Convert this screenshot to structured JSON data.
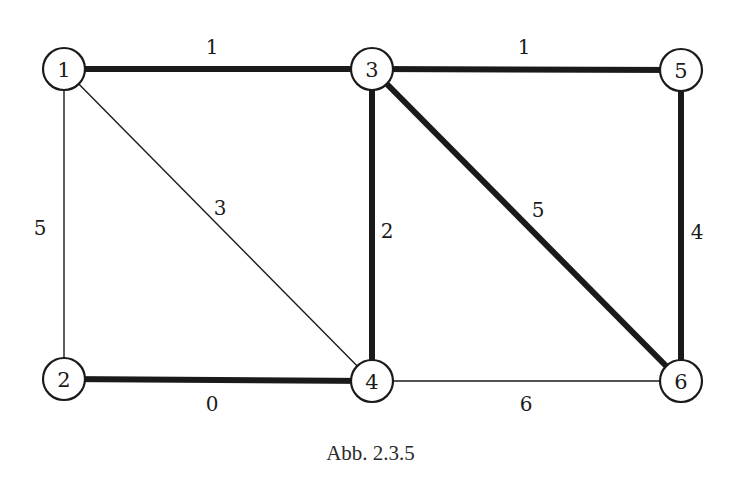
{
  "figure": {
    "caption": "Abb. 2.3.5",
    "colors": {
      "stroke": "#1a1a1a",
      "background": "#ffffff"
    }
  },
  "graph": {
    "nodes": [
      {
        "id": "1",
        "label": "1",
        "x": 64,
        "y": 69
      },
      {
        "id": "2",
        "label": "2",
        "x": 64,
        "y": 379
      },
      {
        "id": "3",
        "label": "3",
        "x": 372,
        "y": 69
      },
      {
        "id": "4",
        "label": "4",
        "x": 372,
        "y": 381
      },
      {
        "id": "5",
        "label": "5",
        "x": 681,
        "y": 70
      },
      {
        "id": "6",
        "label": "6",
        "x": 681,
        "y": 381
      }
    ],
    "edges": [
      {
        "from": "1",
        "to": "3",
        "weight": "1",
        "bold": true,
        "label_x": 212,
        "label_y": 47
      },
      {
        "from": "3",
        "to": "5",
        "weight": "1",
        "bold": true,
        "label_x": 524,
        "label_y": 47
      },
      {
        "from": "1",
        "to": "2",
        "weight": "5",
        "bold": false,
        "label_x": 40,
        "label_y": 228
      },
      {
        "from": "1",
        "to": "4",
        "weight": "3",
        "bold": false,
        "label_x": 220,
        "label_y": 208
      },
      {
        "from": "3",
        "to": "4",
        "weight": "2",
        "bold": true,
        "label_x": 387,
        "label_y": 231
      },
      {
        "from": "3",
        "to": "6",
        "weight": "5",
        "bold": true,
        "label_x": 538,
        "label_y": 210
      },
      {
        "from": "5",
        "to": "6",
        "weight": "4",
        "bold": true,
        "label_x": 697,
        "label_y": 232
      },
      {
        "from": "2",
        "to": "4",
        "weight": "0",
        "bold": true,
        "label_x": 212,
        "label_y": 404
      },
      {
        "from": "4",
        "to": "6",
        "weight": "6",
        "bold": false,
        "label_x": 526,
        "label_y": 404
      }
    ],
    "node_radius": 21
  }
}
